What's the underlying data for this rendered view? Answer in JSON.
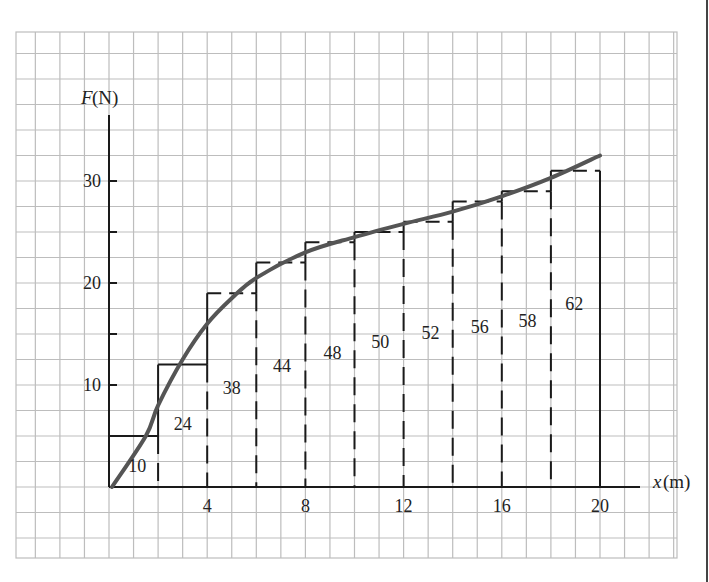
{
  "chart_data": {
    "type": "bar",
    "title": "",
    "xlabel": "x(m)",
    "ylabel": "F(N)",
    "xlim": [
      0,
      20
    ],
    "ylim": [
      0,
      35
    ],
    "x_ticks": [
      4,
      8,
      12,
      16,
      20
    ],
    "y_ticks": [
      10,
      20,
      30
    ],
    "grid": true,
    "bar_width": 2,
    "categories": [
      "0-2",
      "2-4",
      "4-6",
      "6-8",
      "8-10",
      "10-12",
      "12-14",
      "14-16",
      "16-18",
      "18-20"
    ],
    "series": [
      {
        "name": "Bar height F (N)",
        "values": [
          5,
          12,
          19,
          22,
          24,
          25,
          26,
          28,
          29,
          31
        ]
      },
      {
        "name": "Bar area label (J)",
        "values": [
          10,
          24,
          38,
          44,
          48,
          50,
          52,
          56,
          58,
          62
        ]
      }
    ],
    "curve": {
      "name": "F(x) smooth curve",
      "x": [
        0,
        1.5,
        2,
        3,
        4,
        5,
        6,
        8,
        10,
        12,
        14,
        16,
        18,
        20
      ],
      "y": [
        0,
        5,
        8,
        12.5,
        16,
        18.5,
        20.5,
        23,
        24.5,
        25.8,
        27,
        28.5,
        30.3,
        32.5
      ]
    }
  },
  "labels": {
    "y_axis": "F",
    "y_axis_unit": "(N)",
    "x_axis": "x",
    "x_axis_unit": "(m)"
  },
  "colors": {
    "grid": "#bdbdbd",
    "axis": "#1a1a1a",
    "bars": "#1a1a1a",
    "curve": "#555555",
    "text": "#222222"
  }
}
